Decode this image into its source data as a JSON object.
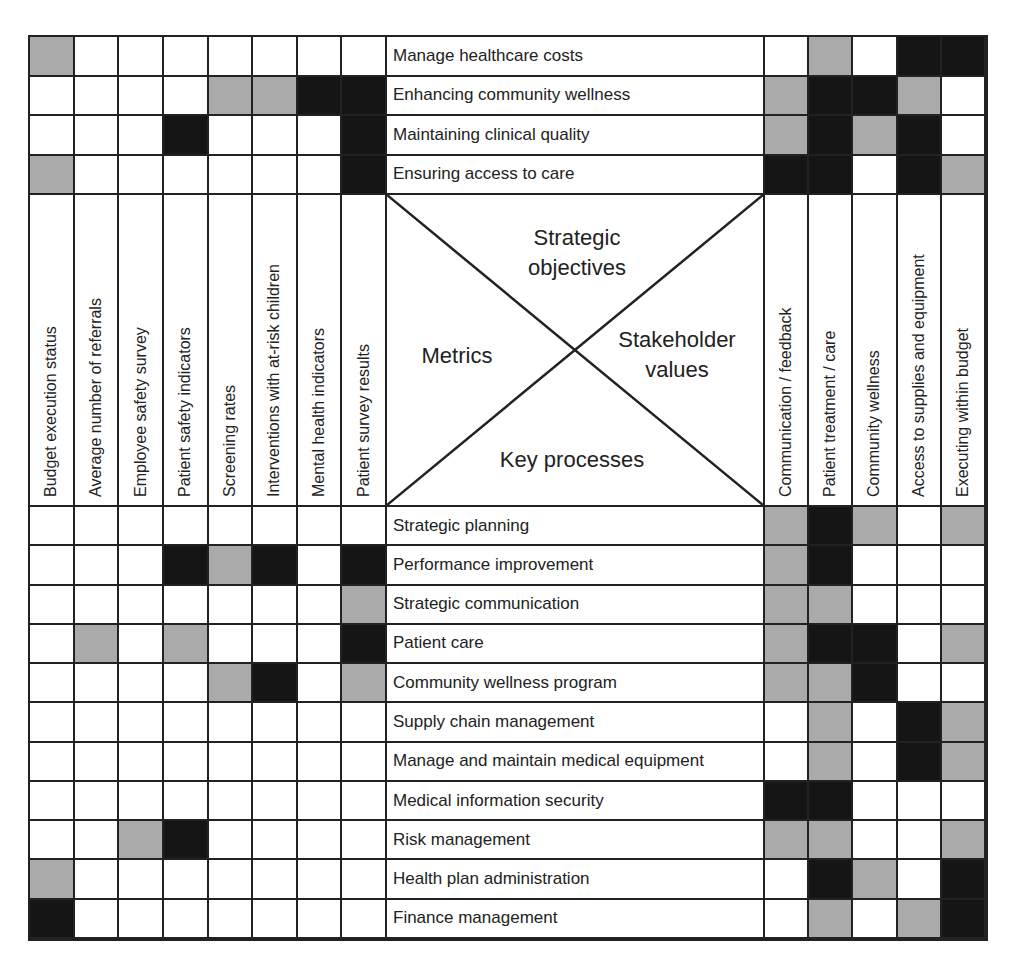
{
  "diagram": {
    "center": {
      "top": "Strategic objectives",
      "top_line1": "Strategic",
      "top_line2": "objectives",
      "left": "Metrics",
      "right_line1": "Stakeholder",
      "right_line2": "values",
      "bottom": "Key processes"
    },
    "metrics": [
      "Budget execution status",
      "Average number of referrals",
      "Employee safety survey",
      "Patient safety indicators",
      "Screening rates",
      "Interventions with at-risk children",
      "Mental health indicators",
      "Patient survey results"
    ],
    "stakeholder_values": [
      "Communication / feedback",
      "Patient treatment / care",
      "Community wellness",
      "Access to supplies and equipment",
      "Executing within budget"
    ],
    "strategic_objectives": [
      {
        "label": "Manage healthcare costs",
        "metrics": "gwwwwwww",
        "values": "wgwbb"
      },
      {
        "label": "Enhancing community wellness",
        "metrics": "wwwwggbb",
        "values": "gbbgw"
      },
      {
        "label": "Maintaining clinical quality",
        "metrics": "wwwbwwwb",
        "values": "gbgbw"
      },
      {
        "label": "Ensuring access to care",
        "metrics": "gwwwwwwb",
        "values": "bbwbg"
      }
    ],
    "key_processes": [
      {
        "label": "Strategic planning",
        "metrics": "wwwwwwww",
        "values": "gbgwg"
      },
      {
        "label": "Performance improvement",
        "metrics": "wwwbgbwb",
        "values": "gbwww"
      },
      {
        "label": "Strategic communication",
        "metrics": "wwwwwwwg",
        "values": "ggwww"
      },
      {
        "label": "Patient care",
        "metrics": "wgwgwwwb",
        "values": "gbbwg"
      },
      {
        "label": "Community wellness program",
        "metrics": "wwwwgbwg",
        "values": "ggbww"
      },
      {
        "label": "Supply chain management",
        "metrics": "wwwwwwww",
        "values": "wgwbg"
      },
      {
        "label": "Manage and maintain medical equipment",
        "metrics": "wwwwwwww",
        "values": "wgwbg"
      },
      {
        "label": "Medical information security",
        "metrics": "wwwwwwww",
        "values": "bbwww"
      },
      {
        "label": "Risk management",
        "metrics": "wwgbwwww",
        "values": "ggwwg"
      },
      {
        "label": "Health plan administration",
        "metrics": "gwwwwwww",
        "values": "wbgwb"
      },
      {
        "label": "Finance management",
        "metrics": "bwwwwwww",
        "values": "wgwgb"
      }
    ],
    "legend": {
      "b": "strong relationship (black)",
      "g": "moderate relationship (gray)",
      "w": "no relationship (white)"
    },
    "colors": {
      "strong": "#151515",
      "moderate": "#aaaaaa",
      "none": "#ffffff",
      "lines": "#222222"
    }
  }
}
